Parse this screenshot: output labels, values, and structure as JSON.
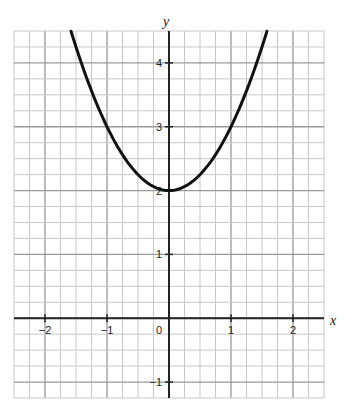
{
  "chart_data": {
    "type": "line",
    "title": "",
    "xlabel": "x",
    "ylabel": "y",
    "xlim": [
      -2.5,
      2.5
    ],
    "ylim": [
      -1.25,
      4.5
    ],
    "grid": true,
    "minor_grid_step": 0.25,
    "x_ticks": [
      "−2",
      "−1",
      "0",
      "1",
      "2"
    ],
    "y_ticks": [
      "−1",
      "1",
      "2",
      "3",
      "4"
    ],
    "series": [
      {
        "name": "y = x^2 + 2",
        "function": "x^2 + 2",
        "x": [
          -1.58,
          -1.5,
          -1.25,
          -1,
          -0.75,
          -0.5,
          -0.25,
          0,
          0.25,
          0.5,
          0.75,
          1,
          1.25,
          1.5,
          1.58
        ],
        "values": [
          4.5,
          4.25,
          3.5625,
          3,
          2.5625,
          2.25,
          2.0625,
          2,
          2.0625,
          2.25,
          2.5625,
          3,
          3.5625,
          4.25,
          4.5
        ]
      }
    ]
  },
  "colors": {
    "minor_grid": "#c8c8c8",
    "major_grid": "#9a9a9a",
    "axis": "#222222",
    "curve": "#111111"
  }
}
